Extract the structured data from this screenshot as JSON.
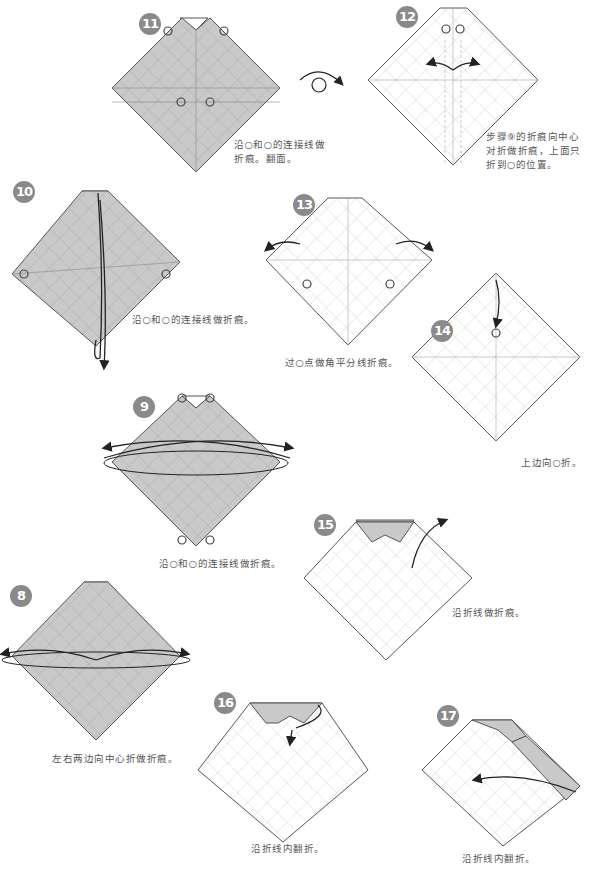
{
  "colors": {
    "paper_gray": "#c9c9c9",
    "paper_white": "#ffffff",
    "line": "#555555",
    "crease": "#aaaaaa",
    "badge": "#8a8a8a"
  },
  "steps": [
    {
      "number": "11",
      "caption": "沿○和○的连接线做\n折痕。翻面。",
      "paper": "gray"
    },
    {
      "number": "12",
      "caption": "步骤⑨的折痕向中心\n对折做折痕，上面只\n折到○的位置。",
      "paper": "white"
    },
    {
      "number": "10",
      "caption": "沿○和○的连接线做折痕。",
      "paper": "gray"
    },
    {
      "number": "13",
      "caption": "过○点做角平分线折痕。",
      "paper": "white"
    },
    {
      "number": "14",
      "caption": "上边向○折。",
      "paper": "white"
    },
    {
      "number": "9",
      "caption": "沿○和○的连接线做折痕。",
      "paper": "gray"
    },
    {
      "number": "15",
      "caption": "沿折线做折痕。",
      "paper": "white"
    },
    {
      "number": "8",
      "caption": "左右两边向中心折做折痕。",
      "paper": "gray"
    },
    {
      "number": "16",
      "caption": "沿折线内翻折。",
      "paper": "white"
    },
    {
      "number": "17",
      "caption": "沿折线内翻折。",
      "paper": "white"
    }
  ],
  "icons": {
    "turn_over": "turn-over-arrow-icon",
    "fold_arrow": "fold-arrow-icon",
    "reference_circle": "reference-circle-icon"
  }
}
